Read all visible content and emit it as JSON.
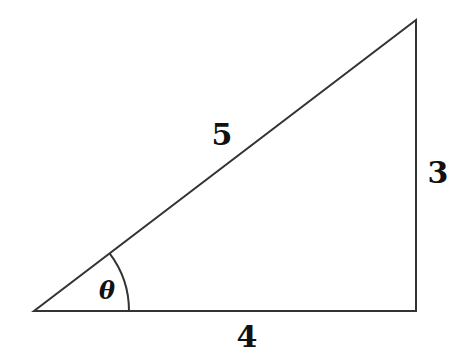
{
  "diagram": {
    "type": "right-triangle",
    "stroke_color": "#333333",
    "vertices": {
      "left": [
        34,
        311
      ],
      "right": [
        416,
        311
      ],
      "top": [
        416,
        20
      ]
    },
    "labels": {
      "hypotenuse": "5",
      "vertical": "3",
      "base": "4",
      "angle": "θ"
    },
    "angle_arc": {
      "center": [
        34,
        311
      ],
      "radius": 95
    }
  }
}
